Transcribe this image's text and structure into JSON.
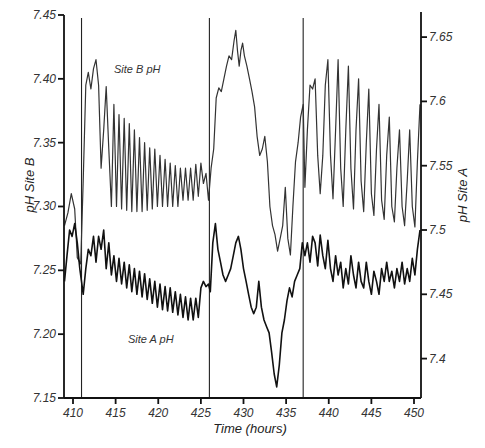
{
  "chart_data": {
    "type": "line",
    "title": "",
    "xlabel": "Time (hours)",
    "ylabel_left": "pH Site B",
    "ylabel_right": "pH Site A",
    "xlim": [
      409,
      451
    ],
    "ylim_left": [
      7.15,
      7.45
    ],
    "ylim_right": [
      7.37,
      7.67
    ],
    "x_ticks": [
      410,
      415,
      420,
      425,
      430,
      435,
      440,
      445,
      450
    ],
    "y_ticks_left": [
      "7.15",
      "7.20",
      "7.25",
      "7.30",
      "7.35",
      "7.40",
      "7.45"
    ],
    "y_ticks_right": [
      "7.4",
      "7.45",
      "7.5",
      "7.55",
      "7.6",
      "7.65"
    ],
    "grid": false,
    "legend": null,
    "vertical_markers": [
      411,
      426,
      437
    ],
    "annotations": [
      {
        "text": "Site B pH",
        "x": 416.5,
        "y_left": 7.4
      },
      {
        "text": "Site A pH",
        "x": 416.5,
        "y_left": 7.2
      }
    ],
    "series": [
      {
        "name": "Site B pH",
        "axis": "left",
        "color": "#333333",
        "points": [
          [
            409.0,
            7.285
          ],
          [
            409.4,
            7.295
          ],
          [
            409.8,
            7.31
          ],
          [
            410.2,
            7.298
          ],
          [
            410.5,
            7.26
          ],
          [
            410.9,
            7.255
          ],
          [
            411.2,
            7.32
          ],
          [
            411.5,
            7.395
          ],
          [
            411.8,
            7.405
          ],
          [
            412.1,
            7.392
          ],
          [
            412.4,
            7.408
          ],
          [
            412.7,
            7.415
          ],
          [
            413.0,
            7.395
          ],
          [
            413.3,
            7.33
          ],
          [
            413.6,
            7.36
          ],
          [
            413.9,
            7.394
          ],
          [
            414.2,
            7.345
          ],
          [
            414.5,
            7.3
          ],
          [
            414.8,
            7.38
          ],
          [
            415.1,
            7.3
          ],
          [
            415.4,
            7.372
          ],
          [
            415.7,
            7.298
          ],
          [
            416.0,
            7.369
          ],
          [
            416.3,
            7.297
          ],
          [
            416.6,
            7.365
          ],
          [
            416.9,
            7.296
          ],
          [
            417.2,
            7.36
          ],
          [
            417.5,
            7.296
          ],
          [
            417.8,
            7.354
          ],
          [
            418.1,
            7.296
          ],
          [
            418.4,
            7.35
          ],
          [
            418.7,
            7.297
          ],
          [
            419.0,
            7.346
          ],
          [
            419.3,
            7.298
          ],
          [
            419.6,
            7.345
          ],
          [
            419.9,
            7.3
          ],
          [
            420.2,
            7.34
          ],
          [
            420.5,
            7.3
          ],
          [
            420.8,
            7.337
          ],
          [
            421.1,
            7.3
          ],
          [
            421.4,
            7.334
          ],
          [
            421.7,
            7.3
          ],
          [
            422.0,
            7.332
          ],
          [
            422.3,
            7.3
          ],
          [
            422.6,
            7.33
          ],
          [
            422.9,
            7.305
          ],
          [
            423.2,
            7.33
          ],
          [
            423.5,
            7.305
          ],
          [
            423.8,
            7.33
          ],
          [
            424.1,
            7.305
          ],
          [
            424.4,
            7.333
          ],
          [
            424.7,
            7.308
          ],
          [
            425.0,
            7.334
          ],
          [
            425.3,
            7.318
          ],
          [
            425.6,
            7.326
          ],
          [
            425.9,
            7.305
          ],
          [
            426.2,
            7.33
          ],
          [
            426.5,
            7.345
          ],
          [
            426.8,
            7.385
          ],
          [
            427.1,
            7.393
          ],
          [
            427.4,
            7.39
          ],
          [
            427.7,
            7.4
          ],
          [
            428.0,
            7.41
          ],
          [
            428.3,
            7.418
          ],
          [
            428.6,
            7.415
          ],
          [
            428.9,
            7.43
          ],
          [
            429.1,
            7.438
          ],
          [
            429.3,
            7.422
          ],
          [
            429.5,
            7.41
          ],
          [
            429.7,
            7.422
          ],
          [
            429.9,
            7.428
          ],
          [
            430.1,
            7.418
          ],
          [
            430.4,
            7.41
          ],
          [
            430.7,
            7.4
          ],
          [
            431.0,
            7.39
          ],
          [
            431.3,
            7.378
          ],
          [
            431.6,
            7.355
          ],
          [
            431.9,
            7.34
          ],
          [
            432.2,
            7.345
          ],
          [
            432.5,
            7.355
          ],
          [
            432.8,
            7.335
          ],
          [
            433.1,
            7.3
          ],
          [
            433.4,
            7.285
          ],
          [
            433.7,
            7.278
          ],
          [
            434.0,
            7.265
          ],
          [
            434.3,
            7.275
          ],
          [
            434.6,
            7.285
          ],
          [
            434.9,
            7.315
          ],
          [
            435.2,
            7.275
          ],
          [
            435.5,
            7.262
          ],
          [
            435.8,
            7.3
          ],
          [
            436.1,
            7.335
          ],
          [
            436.4,
            7.35
          ],
          [
            436.7,
            7.37
          ],
          [
            437.0,
            7.38
          ],
          [
            437.2,
            7.315
          ],
          [
            437.5,
            7.36
          ],
          [
            437.8,
            7.395
          ],
          [
            438.1,
            7.392
          ],
          [
            438.4,
            7.4
          ],
          [
            438.7,
            7.34
          ],
          [
            439.0,
            7.31
          ],
          [
            439.3,
            7.34
          ],
          [
            439.6,
            7.395
          ],
          [
            439.9,
            7.415
          ],
          [
            440.2,
            7.34
          ],
          [
            440.5,
            7.306
          ],
          [
            440.8,
            7.36
          ],
          [
            441.1,
            7.415
          ],
          [
            441.4,
            7.33
          ],
          [
            441.7,
            7.3
          ],
          [
            442.0,
            7.36
          ],
          [
            442.3,
            7.41
          ],
          [
            442.6,
            7.33
          ],
          [
            442.9,
            7.298
          ],
          [
            443.2,
            7.36
          ],
          [
            443.5,
            7.4
          ],
          [
            443.8,
            7.32
          ],
          [
            444.1,
            7.296
          ],
          [
            444.4,
            7.35
          ],
          [
            444.7,
            7.392
          ],
          [
            445.0,
            7.31
          ],
          [
            445.3,
            7.293
          ],
          [
            445.6,
            7.345
          ],
          [
            445.9,
            7.38
          ],
          [
            446.2,
            7.305
          ],
          [
            446.5,
            7.29
          ],
          [
            446.8,
            7.34
          ],
          [
            447.1,
            7.37
          ],
          [
            447.4,
            7.3
          ],
          [
            447.7,
            7.288
          ],
          [
            448.0,
            7.33
          ],
          [
            448.3,
            7.36
          ],
          [
            448.6,
            7.3
          ],
          [
            448.9,
            7.285
          ],
          [
            449.2,
            7.32
          ],
          [
            449.5,
            7.36
          ],
          [
            449.8,
            7.3
          ],
          [
            450.1,
            7.284
          ],
          [
            450.4,
            7.335
          ],
          [
            450.7,
            7.38
          ]
        ]
      },
      {
        "name": "Site A pH",
        "axis": "right",
        "color": "#111111",
        "points": [
          [
            409.0,
            7.46
          ],
          [
            409.3,
            7.48
          ],
          [
            409.6,
            7.5
          ],
          [
            409.9,
            7.495
          ],
          [
            410.2,
            7.505
          ],
          [
            410.5,
            7.49
          ],
          [
            410.8,
            7.47
          ],
          [
            411.0,
            7.46
          ],
          [
            411.2,
            7.45
          ],
          [
            411.5,
            7.47
          ],
          [
            411.8,
            7.485
          ],
          [
            412.1,
            7.48
          ],
          [
            412.4,
            7.495
          ],
          [
            412.7,
            7.475
          ],
          [
            413.0,
            7.495
          ],
          [
            413.3,
            7.485
          ],
          [
            413.6,
            7.5
          ],
          [
            413.9,
            7.47
          ],
          [
            414.2,
            7.49
          ],
          [
            414.5,
            7.465
          ],
          [
            414.8,
            7.48
          ],
          [
            415.1,
            7.46
          ],
          [
            415.4,
            7.478
          ],
          [
            415.7,
            7.458
          ],
          [
            416.0,
            7.475
          ],
          [
            416.3,
            7.455
          ],
          [
            416.6,
            7.473
          ],
          [
            416.9,
            7.452
          ],
          [
            417.2,
            7.47
          ],
          [
            417.5,
            7.45
          ],
          [
            417.8,
            7.468
          ],
          [
            418.1,
            7.448
          ],
          [
            418.4,
            7.466
          ],
          [
            418.7,
            7.446
          ],
          [
            419.0,
            7.462
          ],
          [
            419.3,
            7.443
          ],
          [
            419.6,
            7.46
          ],
          [
            419.9,
            7.44
          ],
          [
            420.2,
            7.458
          ],
          [
            420.5,
            7.438
          ],
          [
            420.8,
            7.456
          ],
          [
            421.1,
            7.437
          ],
          [
            421.4,
            7.455
          ],
          [
            421.7,
            7.436
          ],
          [
            422.0,
            7.452
          ],
          [
            422.3,
            7.434
          ],
          [
            422.6,
            7.45
          ],
          [
            422.9,
            7.432
          ],
          [
            423.2,
            7.448
          ],
          [
            423.5,
            7.43
          ],
          [
            423.8,
            7.447
          ],
          [
            424.1,
            7.43
          ],
          [
            424.4,
            7.447
          ],
          [
            424.7,
            7.432
          ],
          [
            425.0,
            7.455
          ],
          [
            425.3,
            7.46
          ],
          [
            425.6,
            7.456
          ],
          [
            425.9,
            7.458
          ],
          [
            426.1,
            7.452
          ],
          [
            426.4,
            7.49
          ],
          [
            426.7,
            7.505
          ],
          [
            427.0,
            7.485
          ],
          [
            427.3,
            7.475
          ],
          [
            427.6,
            7.465
          ],
          [
            427.9,
            7.46
          ],
          [
            428.2,
            7.465
          ],
          [
            428.5,
            7.47
          ],
          [
            428.8,
            7.48
          ],
          [
            429.1,
            7.49
          ],
          [
            429.4,
            7.495
          ],
          [
            429.7,
            7.485
          ],
          [
            430.0,
            7.47
          ],
          [
            430.3,
            7.46
          ],
          [
            430.6,
            7.45
          ],
          [
            430.9,
            7.44
          ],
          [
            431.2,
            7.435
          ],
          [
            431.5,
            7.44
          ],
          [
            431.8,
            7.46
          ],
          [
            432.1,
            7.44
          ],
          [
            432.4,
            7.43
          ],
          [
            432.7,
            7.425
          ],
          [
            433.0,
            7.42
          ],
          [
            433.3,
            7.405
          ],
          [
            433.6,
            7.388
          ],
          [
            433.9,
            7.378
          ],
          [
            434.2,
            7.395
          ],
          [
            434.5,
            7.42
          ],
          [
            434.8,
            7.43
          ],
          [
            435.1,
            7.445
          ],
          [
            435.4,
            7.455
          ],
          [
            435.7,
            7.448
          ],
          [
            436.0,
            7.46
          ],
          [
            436.3,
            7.465
          ],
          [
            436.6,
            7.47
          ],
          [
            436.9,
            7.49
          ],
          [
            437.2,
            7.48
          ],
          [
            437.5,
            7.49
          ],
          [
            437.8,
            7.475
          ],
          [
            438.1,
            7.495
          ],
          [
            438.4,
            7.49
          ],
          [
            438.7,
            7.472
          ],
          [
            439.0,
            7.496
          ],
          [
            439.3,
            7.48
          ],
          [
            439.6,
            7.47
          ],
          [
            439.9,
            7.492
          ],
          [
            440.2,
            7.47
          ],
          [
            440.5,
            7.46
          ],
          [
            440.8,
            7.48
          ],
          [
            441.1,
            7.465
          ],
          [
            441.4,
            7.475
          ],
          [
            441.7,
            7.455
          ],
          [
            442.0,
            7.47
          ],
          [
            442.3,
            7.458
          ],
          [
            442.6,
            7.48
          ],
          [
            442.9,
            7.465
          ],
          [
            443.2,
            7.455
          ],
          [
            443.5,
            7.475
          ],
          [
            443.8,
            7.46
          ],
          [
            444.1,
            7.455
          ],
          [
            444.4,
            7.475
          ],
          [
            444.7,
            7.46
          ],
          [
            445.0,
            7.45
          ],
          [
            445.3,
            7.468
          ],
          [
            445.6,
            7.46
          ],
          [
            445.9,
            7.45
          ],
          [
            446.2,
            7.47
          ],
          [
            446.5,
            7.46
          ],
          [
            446.8,
            7.475
          ],
          [
            447.1,
            7.46
          ],
          [
            447.4,
            7.468
          ],
          [
            447.7,
            7.455
          ],
          [
            448.0,
            7.47
          ],
          [
            448.3,
            7.46
          ],
          [
            448.6,
            7.475
          ],
          [
            448.9,
            7.458
          ],
          [
            449.2,
            7.47
          ],
          [
            449.5,
            7.46
          ],
          [
            449.8,
            7.478
          ],
          [
            450.1,
            7.465
          ],
          [
            450.4,
            7.485
          ],
          [
            450.7,
            7.5
          ]
        ]
      }
    ]
  }
}
